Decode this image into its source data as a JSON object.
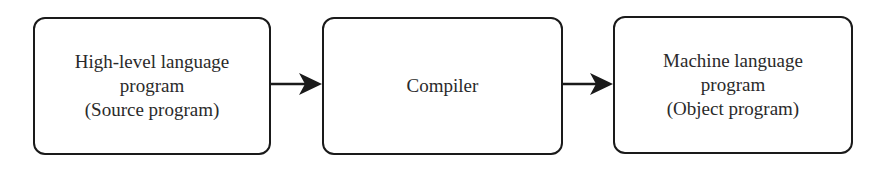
{
  "diagram": {
    "nodes": [
      {
        "id": "source",
        "lines": [
          "High-level language",
          "program",
          "(Source program)"
        ]
      },
      {
        "id": "compiler",
        "lines": [
          "Compiler"
        ]
      },
      {
        "id": "object",
        "lines": [
          "Machine language",
          "program",
          "(Object program)"
        ]
      }
    ],
    "edges": [
      {
        "from": "source",
        "to": "compiler"
      },
      {
        "from": "compiler",
        "to": "object"
      }
    ],
    "colors": {
      "stroke": "#1a1a1a",
      "text": "#2a2a2a",
      "background": "#ffffff"
    }
  }
}
